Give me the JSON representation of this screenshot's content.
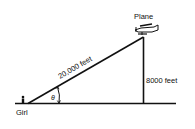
{
  "diagram": {
    "labels": {
      "plane": "Plane",
      "girl": "Girl",
      "hypotenuse": "20,000 feet",
      "height": "8000 feet",
      "angle": "θ"
    },
    "colors": {
      "line": "#111111",
      "background": "#ffffff"
    }
  }
}
